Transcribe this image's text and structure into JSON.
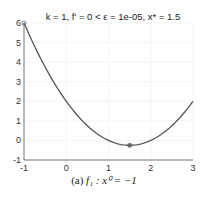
{
  "chart_data": {
    "type": "line",
    "title": "k = 1, f' = 0 < ε = 1e-05, x* = 1.5",
    "xlabel": "",
    "ylabel": "",
    "xlim": [
      -1,
      3
    ],
    "ylim": [
      -1,
      6
    ],
    "xticks": [
      "-1",
      "0",
      "1",
      "2",
      "3"
    ],
    "yticks": [
      "-1",
      "0",
      "1",
      "2",
      "3",
      "4",
      "5",
      "6"
    ],
    "grid": true,
    "series": [
      {
        "name": "f1(x)",
        "x": [
          -1,
          -0.5,
          0,
          0.5,
          1,
          1.5,
          2,
          2.5,
          3
        ],
        "values": [
          6,
          3.75,
          2,
          0.75,
          0,
          -0.25,
          0,
          0.75,
          2
        ]
      }
    ],
    "markers": [
      {
        "label": "x0",
        "x": -1,
        "y": 6
      },
      {
        "label": "x*",
        "x": 1.5,
        "y": -0.25
      }
    ]
  },
  "caption": {
    "prefix": "(a)",
    "text": "f₁ : x⁰ = −1"
  }
}
